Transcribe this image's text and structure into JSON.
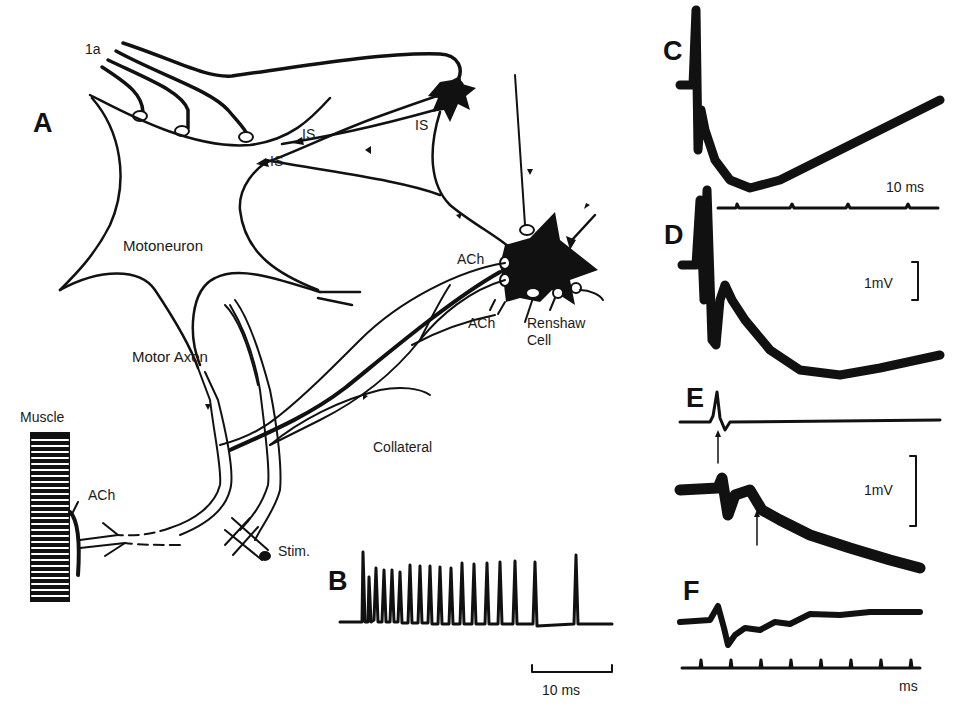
{
  "figure": {
    "panels": [
      "A",
      "B",
      "C",
      "D",
      "E",
      "F"
    ],
    "panel_a": {
      "labels": {
        "afferent": "1a",
        "motoneuron": "Motoneuron",
        "motor_axon": "Motor Axon",
        "muscle": "Muscle",
        "ach_muscle": "ACh",
        "is_upper": "IS",
        "is_lower": "IS",
        "is_interneuron": "IS",
        "ach_renshaw_upper": "ACh",
        "ach_renshaw_lower": "ACh",
        "renshaw_line1": "Renshaw",
        "renshaw_line2": "Cell",
        "collateral": "Collateral",
        "stim": "Stim."
      }
    },
    "panel_b": {
      "description": "Renshaw cell high-frequency burst of spikes",
      "scale_bar": "10 ms"
    },
    "panel_c": {
      "scale_bar": "10 ms"
    },
    "panel_d": {
      "scale_bar": "1mV"
    },
    "panel_e": {
      "scale_bar": "1mV"
    },
    "panel_f": {
      "time_axis_label": "ms"
    }
  },
  "colors": {
    "ink": "#111111",
    "background": "#ffffff"
  }
}
